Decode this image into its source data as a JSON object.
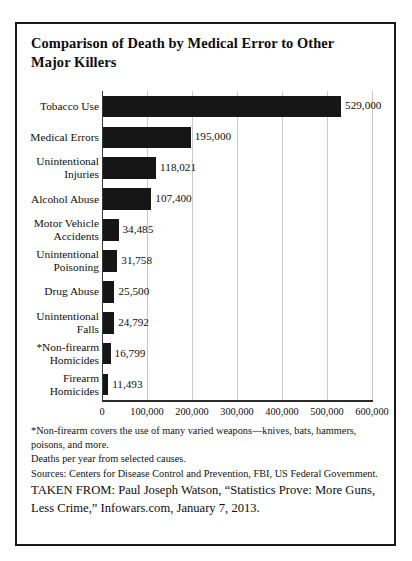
{
  "figure": {
    "title": "Comparison of Death by Medical Error to Other Major Killers"
  },
  "chart_data": {
    "type": "bar",
    "orientation": "horizontal",
    "title": "Comparison of Death by Medical Error to Other Major Killers",
    "xlabel": "",
    "ylabel": "",
    "xlim": [
      0,
      600000
    ],
    "xticks": [
      0,
      100000,
      200000,
      300000,
      400000,
      500000,
      600000
    ],
    "xtick_labels": [
      "0",
      "100,000",
      "200,000",
      "300,000",
      "400,000",
      "500,000",
      "600,000"
    ],
    "grid": true,
    "legend": false,
    "bar_color": "#161616",
    "categories": [
      "Tobacco Use",
      "Medical Errors",
      "Unintentional Injuries",
      "Alcohol Abuse",
      "Motor Vehicle Accidents",
      "Unintentional Poisoning",
      "Drug Abuse",
      "Unintentional Falls",
      "*Non-firearm Homicides",
      "Firearm Homicides"
    ],
    "values": [
      529000,
      195000,
      118021,
      107400,
      34485,
      31758,
      25500,
      24792,
      16799,
      11493
    ],
    "value_labels": [
      "529,000",
      "195,000",
      "118,021",
      "107,400",
      "34,485",
      "31,758",
      "25,500",
      "24,792",
      "16,799",
      "11,493"
    ],
    "category_label_lines": [
      [
        "Tobacco Use"
      ],
      [
        "Medical Errors"
      ],
      [
        "Unintentional",
        "Injuries"
      ],
      [
        "Alcohol Abuse"
      ],
      [
        "Motor Vehicle",
        "Accidents"
      ],
      [
        "Unintentional",
        "Poisoning"
      ],
      [
        "Drug Abuse"
      ],
      [
        "Unintentional",
        "Falls"
      ],
      [
        "*Non-firearm",
        "Homicides"
      ],
      [
        "Firearm",
        "Homicides"
      ]
    ]
  },
  "footnotes": {
    "line1": "*Non-firearm covers the use of many varied weapons—knives, bats, hammers, poisons, and more.",
    "line2": "Deaths per year from selected causes.",
    "line3": "Sources: Centers for Disease Control and Prevention, FBI, US Federal Government."
  },
  "attribution": {
    "text": "TAKEN FROM: Paul Joseph Watson, “Statistics Prove: More Guns, Less Crime,” Infowars.com, January 7, 2013."
  }
}
